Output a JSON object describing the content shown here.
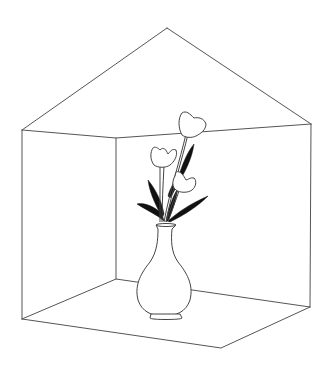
{
  "illustration": {
    "title": "Vase of flowers in a room corner",
    "background_color": "#ffffff",
    "line_color": "#555555",
    "leaf_color": "#111111",
    "room": {
      "apex": [
        167,
        28
      ],
      "top_left": [
        22,
        130
      ],
      "top_inner": [
        116,
        138
      ],
      "top_right": [
        311,
        124
      ],
      "bottom_left": [
        22,
        319
      ],
      "bottom_inner": [
        116,
        279
      ],
      "bottom_right": [
        310,
        307
      ],
      "bottom_front": [
        221,
        348
      ]
    },
    "objects": [
      {
        "name": "vase",
        "count": 1
      },
      {
        "name": "flower",
        "count": 3
      },
      {
        "name": "leaf",
        "count": 6
      }
    ]
  }
}
